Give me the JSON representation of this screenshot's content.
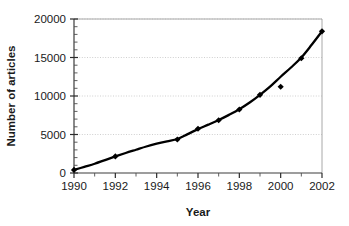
{
  "chart_data": {
    "type": "scatter",
    "title": "",
    "subtitle": "",
    "xlabel": "Year",
    "ylabel": "Number of articles",
    "xlim": [
      1990,
      2002
    ],
    "ylim": [
      0,
      20000
    ],
    "grid": true,
    "grid_axis": "y",
    "legend": false,
    "legend_position": "none",
    "marker": "diamond",
    "marker_color": "#000000",
    "line_color": "#000000",
    "trendline": "exponential fit through data points",
    "x_ticks_major": [
      1990,
      1992,
      1994,
      1996,
      1998,
      2000,
      2002
    ],
    "x_tick_labels": [
      "1990",
      "1992",
      "1994",
      "1996",
      "1998",
      "2000",
      "2002"
    ],
    "x_ticks_minor": [
      1991,
      1993,
      1995,
      1997,
      1999,
      2001
    ],
    "y_ticks_major": [
      0,
      5000,
      10000,
      15000,
      20000
    ],
    "y_tick_labels": [
      "0",
      "5000",
      "10000",
      "15000",
      "20000"
    ],
    "y_ticks_minor": [
      1000,
      2000,
      3000,
      4000,
      6000,
      7000,
      8000,
      9000,
      11000,
      12000,
      13000,
      14000,
      16000,
      17000,
      18000,
      19000
    ],
    "x": [
      1990,
      1992,
      1995,
      1996,
      1997,
      1998,
      1999,
      2000,
      2001,
      2002
    ],
    "values": [
      400,
      2150,
      4350,
      5750,
      6850,
      8250,
      10150,
      11200,
      14900,
      18400
    ],
    "points": [
      {
        "x": 1990,
        "y": 400
      },
      {
        "x": 1992,
        "y": 2150
      },
      {
        "x": 1995,
        "y": 4350
      },
      {
        "x": 1996,
        "y": 5750
      },
      {
        "x": 1997,
        "y": 6850
      },
      {
        "x": 1998,
        "y": 8250
      },
      {
        "x": 1999,
        "y": 10150
      },
      {
        "x": 2000,
        "y": 11200
      },
      {
        "x": 2001,
        "y": 14900
      },
      {
        "x": 2002,
        "y": 18400
      }
    ],
    "curve": [
      {
        "x": 1990.0,
        "y": 400
      },
      {
        "x": 1990.5,
        "y": 800
      },
      {
        "x": 1991.0,
        "y": 1200
      },
      {
        "x": 1991.5,
        "y": 1680
      },
      {
        "x": 1992.0,
        "y": 2150
      },
      {
        "x": 1992.5,
        "y": 2600
      },
      {
        "x": 1993.0,
        "y": 3020
      },
      {
        "x": 1993.5,
        "y": 3440
      },
      {
        "x": 1994.0,
        "y": 3800
      },
      {
        "x": 1994.5,
        "y": 4120
      },
      {
        "x": 1995.0,
        "y": 4420
      },
      {
        "x": 1995.5,
        "y": 5050
      },
      {
        "x": 1996.0,
        "y": 5700
      },
      {
        "x": 1996.5,
        "y": 6280
      },
      {
        "x": 1997.0,
        "y": 6880
      },
      {
        "x": 1997.5,
        "y": 7550
      },
      {
        "x": 1998.0,
        "y": 8280
      },
      {
        "x": 1998.5,
        "y": 9150
      },
      {
        "x": 1999.0,
        "y": 10150
      },
      {
        "x": 1999.5,
        "y": 11250
      },
      {
        "x": 2000.0,
        "y": 12500
      },
      {
        "x": 2000.5,
        "y": 13700
      },
      {
        "x": 2001.0,
        "y": 15000
      },
      {
        "x": 2001.5,
        "y": 16650
      },
      {
        "x": 2002.0,
        "y": 18400
      }
    ],
    "colors": {
      "background": "#ffffff",
      "frame": "#a8a8a8",
      "grid": "#cfcfcf",
      "axis": "#4d4d4d",
      "text": "#1a1a1a",
      "data": "#000000"
    }
  }
}
